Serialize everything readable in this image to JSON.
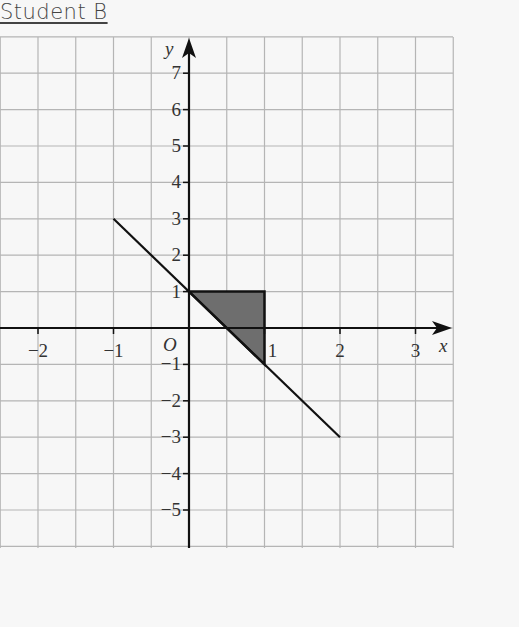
{
  "header": {
    "title": "Student B"
  },
  "chart_data": {
    "type": "line",
    "title": "Student B",
    "xlabel": "x",
    "ylabel": "y",
    "origin_label": "O",
    "xlim": [
      -2.5,
      3.5
    ],
    "ylim": [
      -6,
      8
    ],
    "x_ticks": [
      -2,
      -1,
      1,
      2,
      3
    ],
    "x_tick_labels": [
      "−2",
      "−1",
      "1",
      "2",
      "3"
    ],
    "y_ticks": [
      7,
      6,
      5,
      4,
      3,
      2,
      1,
      -1,
      -2,
      -3,
      -4,
      -5
    ],
    "y_tick_labels": [
      "7",
      "6",
      "5",
      "4",
      "3",
      "2",
      "1",
      "−1",
      "−2",
      "−3",
      "−4",
      "−5"
    ],
    "grid": true,
    "series": [
      {
        "name": "line y = 1 - 2x",
        "x": [
          -1,
          2
        ],
        "y": [
          3,
          -3
        ]
      }
    ],
    "shaded_region": {
      "description": "region bounded by y=1, x=1 and the line y=1-2x",
      "vertices": [
        [
          0,
          1
        ],
        [
          1,
          1
        ],
        [
          1,
          -1
        ]
      ],
      "fill": "#6e6e6e"
    },
    "colors": {
      "grid": "#b5b5b5",
      "axis": "#111111",
      "background": "#f7f7f7"
    }
  }
}
